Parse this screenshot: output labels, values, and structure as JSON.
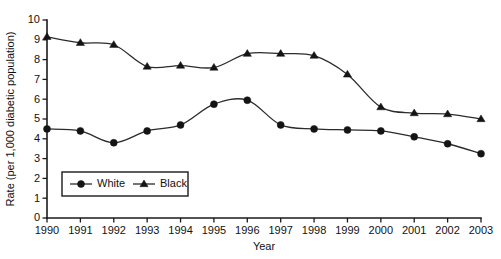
{
  "chart_data": {
    "type": "line",
    "title": "",
    "xlabel": "Year",
    "ylabel": "Rate (per 1,000 diabetic population)",
    "categories": [
      "1990",
      "1991",
      "1992",
      "1993",
      "1994",
      "1995",
      "1996",
      "1997",
      "1998",
      "1999",
      "2000",
      "2001",
      "2002",
      "2003"
    ],
    "x": [
      1990,
      1991,
      1992,
      1993,
      1994,
      1995,
      1996,
      1997,
      1998,
      1999,
      2000,
      2001,
      2002,
      2003
    ],
    "series": [
      {
        "name": "White",
        "marker": "circle",
        "values": [
          4.5,
          4.4,
          3.8,
          4.4,
          4.7,
          5.75,
          5.95,
          4.7,
          4.5,
          4.45,
          4.4,
          4.1,
          3.75,
          3.25
        ]
      },
      {
        "name": "Black",
        "marker": "triangle",
        "values": [
          9.15,
          8.85,
          8.75,
          7.65,
          7.7,
          7.6,
          8.3,
          8.3,
          8.2,
          7.25,
          5.6,
          5.3,
          5.25,
          5.0
        ]
      }
    ],
    "ylim": [
      0,
      10
    ],
    "yticks": [
      "0",
      "1",
      "2",
      "3",
      "4",
      "5",
      "6",
      "7",
      "8",
      "9",
      "10"
    ],
    "ytick_values": [
      0,
      1,
      2,
      3,
      4,
      5,
      6,
      7,
      8,
      9,
      10
    ],
    "xlim": [
      1990,
      2003
    ],
    "grid": false,
    "legend_position": "lower-left-inside",
    "colors": {
      "line": "#2b2b2b",
      "marker": "#141414",
      "axis": "#1a1a1a",
      "background": "#ffffff"
    }
  },
  "legend": {
    "entries": [
      {
        "label": "White",
        "marker": "circle-marker"
      },
      {
        "label": "Black",
        "marker": "triangle-marker"
      }
    ]
  }
}
